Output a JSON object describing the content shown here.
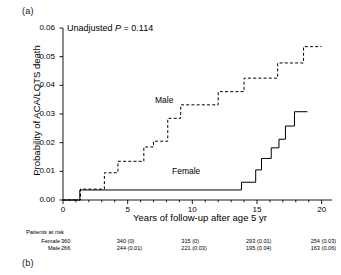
{
  "figure": {
    "panel_a_label": "(a)",
    "panel_b_label": "(b)"
  },
  "annotation": {
    "p_value_prefix": "Unadjusted ",
    "p_italic": "P",
    "p_value_text": " = 0.114",
    "p_value_full": "Unadjusted P = 0.114"
  },
  "labels": {
    "male": "Male",
    "female": "Female"
  },
  "risk_table": {
    "title": "Patients at risk",
    "row_names": [
      "Female",
      "Male"
    ],
    "female_values": [
      "360",
      "340  (0)",
      "315  (0)",
      "293  (0.01)",
      "254  (0.03)"
    ],
    "male_values": [
      "266",
      "244  (0.01)",
      "221  (0.03)",
      "195  (0.04)",
      "163  (0.06)"
    ]
  },
  "chart_data": {
    "type": "line",
    "title": "",
    "subtitle": "",
    "xlabel": "Years of follow-up after age 5 yr",
    "ylabel": "Probability of ACA/LQTS death",
    "xlim": [
      0,
      20.8
    ],
    "ylim": [
      0,
      0.06
    ],
    "xticks": [
      0,
      5,
      10,
      15,
      20
    ],
    "xtick_labels": [
      "0",
      "5",
      "10",
      "15",
      "20"
    ],
    "xminor_ticks": [
      1,
      2,
      3,
      4,
      6,
      7,
      8,
      9,
      11,
      12,
      13,
      14,
      16,
      17,
      18,
      19
    ],
    "yticks": [
      0.0,
      0.01,
      0.02,
      0.03,
      0.04,
      0.05,
      0.06
    ],
    "ytick_labels": [
      "0.00",
      "0.01",
      "0.02",
      "0.03",
      "0.04",
      "0.05",
      "0.06"
    ],
    "grid": false,
    "legend_position": "inline-curve-labels",
    "annotations": [
      {
        "text": "Unadjusted P = 0.114",
        "x": 1.4,
        "y": 0.0575
      },
      {
        "text": "Male",
        "x": 8.2,
        "y": 0.0345
      },
      {
        "text": "Female",
        "x": 9.8,
        "y": 0.0052
      }
    ],
    "series": [
      {
        "name": "Male",
        "style": "dashed",
        "color": "#000000",
        "steps": [
          [
            0.0,
            0.0
          ],
          [
            1.35,
            0.0
          ],
          [
            1.35,
            0.0038
          ],
          [
            3.2,
            0.0038
          ],
          [
            3.2,
            0.0095
          ],
          [
            4.25,
            0.0095
          ],
          [
            4.25,
            0.0135
          ],
          [
            6.25,
            0.0135
          ],
          [
            6.25,
            0.0185
          ],
          [
            7.0,
            0.0185
          ],
          [
            7.0,
            0.0205
          ],
          [
            8.1,
            0.0205
          ],
          [
            8.1,
            0.0285
          ],
          [
            9.1,
            0.0285
          ],
          [
            9.1,
            0.0332
          ],
          [
            12.0,
            0.0332
          ],
          [
            12.0,
            0.0378
          ],
          [
            14.0,
            0.0378
          ],
          [
            14.0,
            0.0425
          ],
          [
            16.6,
            0.0425
          ],
          [
            16.6,
            0.0478
          ],
          [
            18.6,
            0.0478
          ],
          [
            18.6,
            0.0535
          ],
          [
            20.0,
            0.0535
          ]
        ]
      },
      {
        "name": "Female",
        "style": "solid",
        "color": "#000000",
        "steps": [
          [
            0.0,
            0.0
          ],
          [
            1.3,
            0.0
          ],
          [
            1.3,
            0.0035
          ],
          [
            13.8,
            0.0035
          ],
          [
            13.8,
            0.0062
          ],
          [
            14.9,
            0.0062
          ],
          [
            14.9,
            0.0105
          ],
          [
            15.35,
            0.0105
          ],
          [
            15.35,
            0.0145
          ],
          [
            16.1,
            0.0145
          ],
          [
            16.1,
            0.0182
          ],
          [
            16.7,
            0.0182
          ],
          [
            16.7,
            0.0212
          ],
          [
            17.2,
            0.0212
          ],
          [
            17.2,
            0.0258
          ],
          [
            17.9,
            0.0258
          ],
          [
            17.9,
            0.0308
          ],
          [
            18.9,
            0.0308
          ]
        ]
      }
    ],
    "risk_table_x_positions": [
      0,
      5,
      10,
      15,
      20
    ]
  }
}
